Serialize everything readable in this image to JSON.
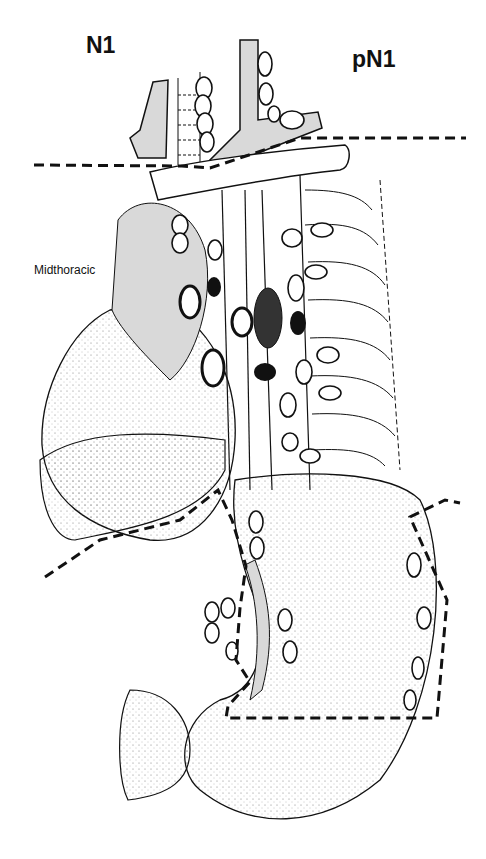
{
  "labels": {
    "left_title": "N1",
    "right_title": "pN1",
    "region": "Midthoracic"
  },
  "colors": {
    "background": "#ffffff",
    "line": "#111111",
    "shade": "#d9d9d9",
    "node_fill": "#ffffff",
    "positive_node": "#111111"
  },
  "figure": {
    "legend": []
  }
}
